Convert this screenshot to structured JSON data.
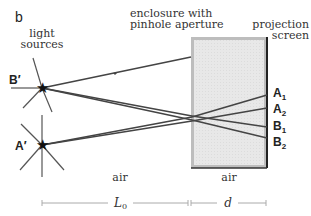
{
  "panel_label": "b",
  "labels": {
    "light_sources": [
      "light",
      "sources"
    ],
    "enclosure": [
      "enclosure with",
      "pinhole aperture"
    ],
    "projection_screen": [
      "projection",
      "screen"
    ],
    "air_outside": "air",
    "air_inside": "air",
    "source_B": "B′",
    "source_A": "A′",
    "screen_points": [
      {
        "main": "A",
        "sub": "1"
      },
      {
        "main": "A",
        "sub": "2"
      },
      {
        "main": "B",
        "sub": "1"
      },
      {
        "main": "B",
        "sub": "2"
      }
    ],
    "dim_L0": "L",
    "dim_L0_sub": "0",
    "dim_d": "d"
  },
  "colors": {
    "ray": "#444444",
    "enclosure_fill": "#e6e6e6",
    "enclosure_border": "#999999",
    "screen": "#222222",
    "dimension_line": "#aaaaaa"
  }
}
